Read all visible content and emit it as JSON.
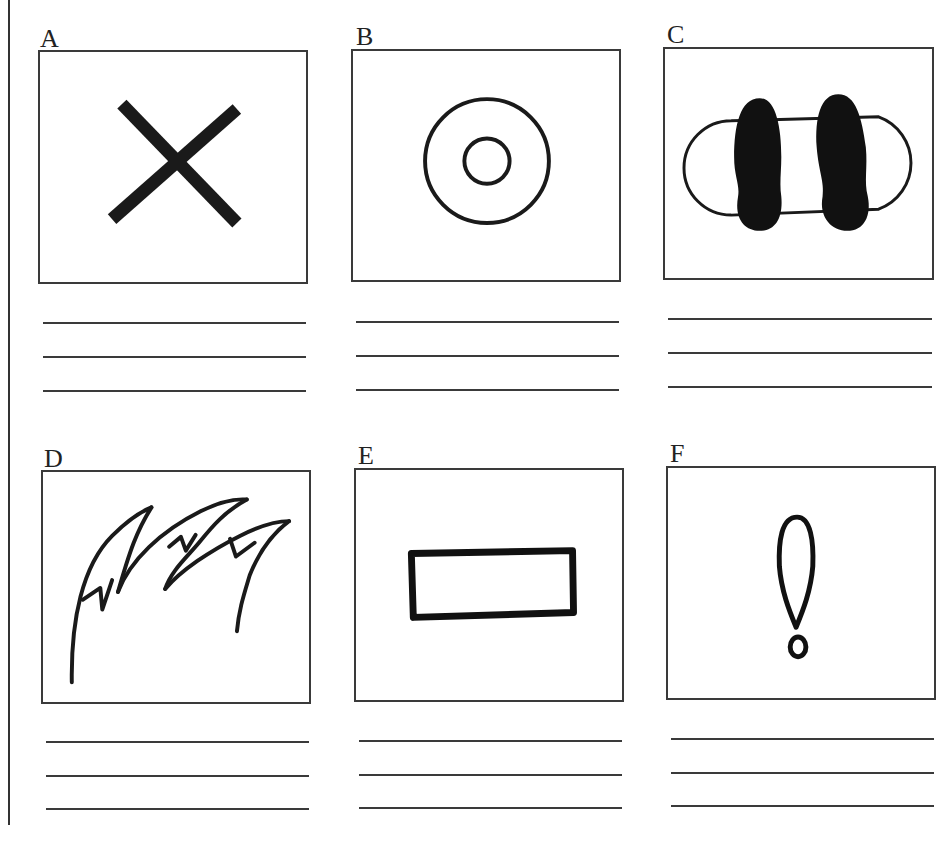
{
  "worksheet": {
    "panels": [
      {
        "letter": "A",
        "symbol": "x-cross-icon",
        "answer_lines": [
          "",
          "",
          ""
        ]
      },
      {
        "letter": "B",
        "symbol": "concentric-circles-icon",
        "answer_lines": [
          "",
          "",
          ""
        ]
      },
      {
        "letter": "C",
        "symbol": "footprints-on-mat-icon",
        "answer_lines": [
          "",
          "",
          ""
        ]
      },
      {
        "letter": "D",
        "symbol": "flames-grass-icon",
        "answer_lines": [
          "",
          "",
          ""
        ]
      },
      {
        "letter": "E",
        "symbol": "rectangle-outline-icon",
        "answer_lines": [
          "",
          "",
          ""
        ]
      },
      {
        "letter": "F",
        "symbol": "exclamation-mark-icon",
        "answer_lines": [
          "",
          "",
          ""
        ]
      }
    ]
  },
  "colors": {
    "ink": "#1a1a1a",
    "frame": "#3a3a3a",
    "background": "#ffffff"
  }
}
